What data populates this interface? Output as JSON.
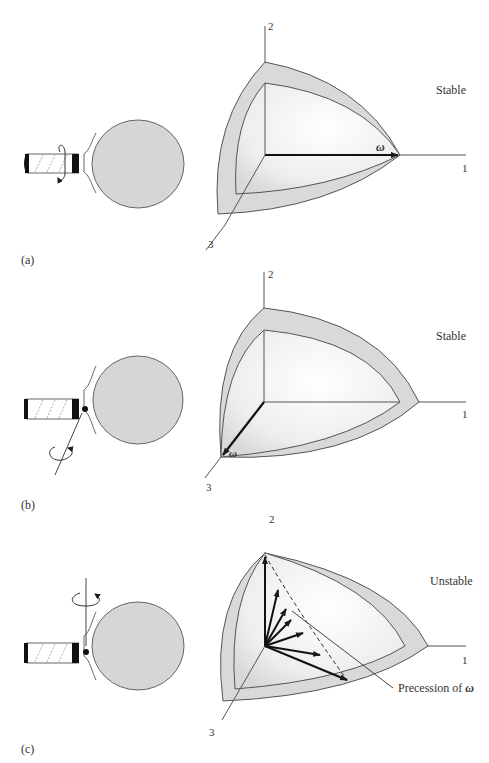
{
  "figure": {
    "panels": [
      {
        "id": "a",
        "caption": "(a)",
        "stability": "Stable",
        "rotation_axis": "axis 1 (along handle)",
        "omega_label": "ω",
        "axes": {
          "x": "1",
          "y": "2",
          "z": "3"
        }
      },
      {
        "id": "b",
        "caption": "(b)",
        "stability": "Stable",
        "rotation_axis": "axis 3 (perpendicular to blade)",
        "omega_label": "ω",
        "axes": {
          "x": "1",
          "y": "2",
          "z": "3"
        }
      },
      {
        "id": "c",
        "caption": "(c)",
        "stability": "Unstable",
        "rotation_axis": "axis 2 (intermediate)",
        "omega_label": "ω",
        "precession_label": "Precession of",
        "axes": {
          "x": "1",
          "y": "2",
          "z": "3"
        }
      }
    ],
    "colors": {
      "shell_fill": "#d9d9d9",
      "inner_fill": "#ececec",
      "blade_fill": "#d6d6d6",
      "stroke": "#555555",
      "arrow": "#1a1a1a"
    }
  }
}
